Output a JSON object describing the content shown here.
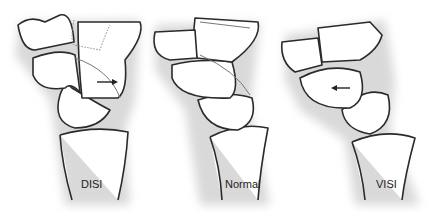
{
  "figure": {
    "panels": [
      {
        "id": "disi",
        "label": "DISI",
        "arrow_direction": "right"
      },
      {
        "id": "normal",
        "label": "Normal",
        "arrow_direction": "none"
      },
      {
        "id": "visi",
        "label": "VISI",
        "arrow_direction": "left"
      }
    ],
    "colors": {
      "outline": "#2a2a2a",
      "shadow": "#d9d9d9",
      "background": "#ffffff"
    }
  }
}
